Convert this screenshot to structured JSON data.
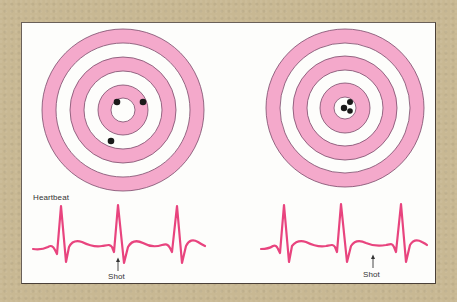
{
  "colors": {
    "background": "#c8b893",
    "panel": "#fdfdfb",
    "ring_pink": "#f4a9cb",
    "ring_outline": "#7a4a6a",
    "ecg_line": "#e8447e",
    "shot_hole": "#1a1a1a"
  },
  "left_panel": {
    "target": {
      "center": [
        123,
        110
      ],
      "ring_radii": [
        81,
        67,
        53,
        39,
        25,
        12
      ],
      "shots": [
        [
          119,
          101
        ],
        [
          143,
          101
        ],
        [
          113,
          140
        ]
      ]
    },
    "heartbeat_label": "Heartbeat",
    "shot_label": "Shot"
  },
  "right_panel": {
    "target": {
      "center": [
        345,
        108
      ],
      "ring_radii": [
        81,
        67,
        53,
        39,
        25,
        12
      ],
      "shots": [
        [
          348,
          102
        ],
        [
          344,
          109
        ],
        [
          350,
          111
        ]
      ]
    },
    "shot_label": "Shot"
  }
}
